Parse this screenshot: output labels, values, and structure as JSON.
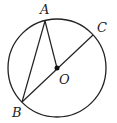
{
  "diagram": {
    "type": "geometry-circle",
    "circle": {
      "center_label": "O",
      "cx": 57,
      "cy": 68,
      "r": 49
    },
    "points": [
      {
        "label": "A",
        "x": 45,
        "y": 21
      },
      {
        "label": "B",
        "x": 22,
        "y": 102
      },
      {
        "label": "C",
        "x": 93,
        "y": 35
      },
      {
        "label": "O",
        "x": 57,
        "y": 68
      }
    ],
    "segments": [
      "AB",
      "AO",
      "BC"
    ],
    "labels": {
      "A": "A",
      "B": "B",
      "C": "C",
      "O": "O"
    },
    "colors": {
      "stroke": "#222222",
      "background": "#ffffff"
    }
  }
}
